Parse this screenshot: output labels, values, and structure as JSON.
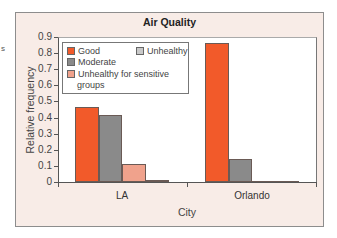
{
  "stray_text": "s",
  "chart_data": {
    "type": "bar",
    "title": "Air Quality",
    "xlabel": "City",
    "ylabel": "Relative frequency",
    "categories": [
      "LA",
      "Orlando"
    ],
    "series": [
      {
        "name": "Good",
        "color": "#f25a2a",
        "values": [
          0.465,
          0.86
        ]
      },
      {
        "name": "Moderate",
        "color": "#8a8a8a",
        "values": [
          0.415,
          0.14
        ]
      },
      {
        "name": "Unhealthy for sensitive groups",
        "color": "#f0a28c",
        "values": [
          0.11,
          0.003
        ]
      },
      {
        "name": "Unhealthy",
        "color": "#c9c9c9",
        "values": [
          0.015,
          0.003
        ]
      }
    ],
    "yticks": [
      "0",
      "0.1",
      "0.2",
      "0.3",
      "0.4",
      "0.5",
      "0.6",
      "0.7",
      "0.8",
      "0.9"
    ],
    "ylim": [
      0,
      0.9
    ],
    "grid": false,
    "legend_position": "upper left, inside plot",
    "legend": {
      "good": "Good",
      "moderate": "Moderate",
      "usg_line1": "Unhealthy for sensitive",
      "usg_line2": "groups",
      "unhealthy": "Unhealthy"
    }
  }
}
